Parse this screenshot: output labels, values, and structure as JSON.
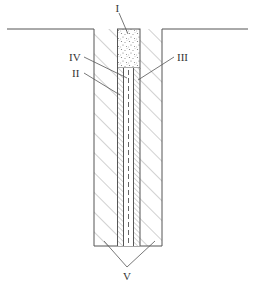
{
  "diagram": {
    "type": "cross-section",
    "labels": [
      {
        "id": "I",
        "text": "I",
        "points_to": "granular fill plug at top of hole"
      },
      {
        "id": "II",
        "text": "II",
        "points_to": "left inner hatched band"
      },
      {
        "id": "III",
        "text": "III",
        "points_to": "right inner hatched band"
      },
      {
        "id": "IV",
        "text": "IV",
        "points_to": "central core with dashed axis"
      },
      {
        "id": "V",
        "text": "V",
        "points_to": "outer hatched walls (both sides)"
      }
    ],
    "colors": {
      "line": "#555555",
      "hatch": "#9a9a9a",
      "background": "#ffffff"
    }
  }
}
